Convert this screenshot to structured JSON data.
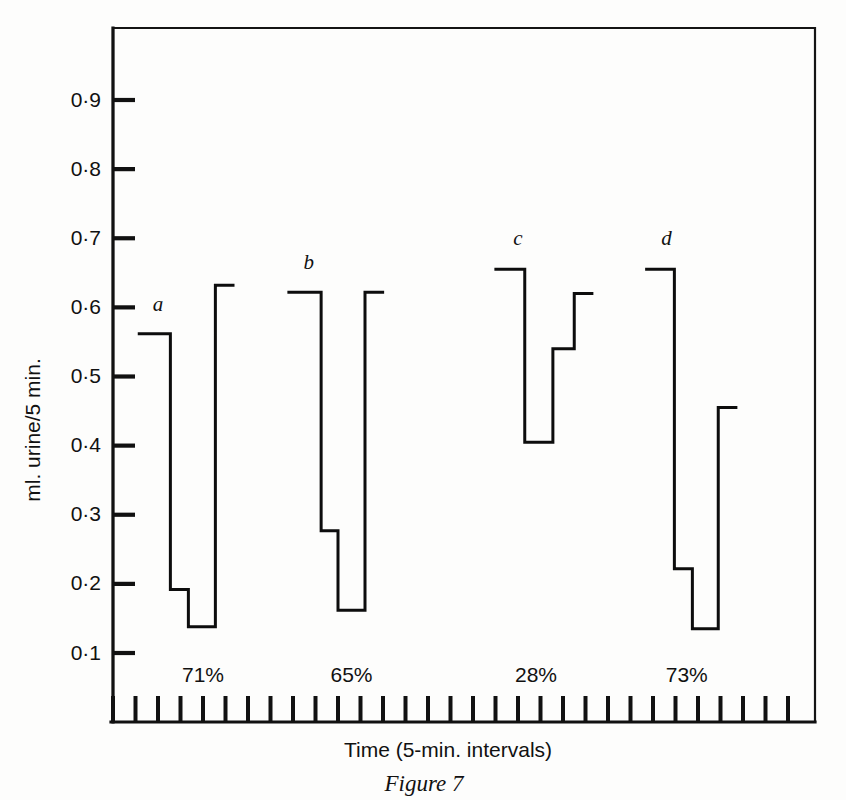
{
  "figure": {
    "caption": "Figure 7",
    "y_axis_title": "ml. urine/5 min.",
    "x_axis_title": "Time (5-min. intervals)"
  },
  "chart_data": {
    "type": "line",
    "title": "",
    "subtitle": "",
    "xlabel": "Time (5-min. intervals)",
    "ylabel": "ml. urine/5 min.",
    "ylim": [
      0,
      1.0
    ],
    "xlim": [
      0,
      31
    ],
    "grid": false,
    "legend": "none",
    "step_style": "post",
    "y_tick_labels": [
      "0·9",
      "0·8",
      "0·7",
      "0·6",
      "0·5",
      "0·4",
      "0·3",
      "0·2",
      "0·1"
    ],
    "y_tick_values": [
      0.9,
      0.8,
      0.7,
      0.6,
      0.5,
      0.4,
      0.3,
      0.2,
      0.1
    ],
    "x_tick_count": 31,
    "x_tick_labels": [],
    "annotations": [
      {
        "name": "a",
        "text": "a",
        "x": 2.0,
        "y": 0.595
      },
      {
        "name": "b",
        "text": "b",
        "x": 8.7,
        "y": 0.655
      },
      {
        "name": "c",
        "text": "c",
        "x": 18.0,
        "y": 0.69
      },
      {
        "name": "d",
        "text": "d",
        "x": 24.6,
        "y": 0.69
      }
    ],
    "percent_labels": [
      {
        "text": "71%",
        "x": 4.0
      },
      {
        "text": "65%",
        "x": 10.6
      },
      {
        "text": "28%",
        "x": 18.8
      },
      {
        "text": "73%",
        "x": 25.5
      }
    ],
    "series": [
      {
        "name": "a",
        "points": [
          {
            "x": 1.1,
            "y": 0.562
          },
          {
            "x": 2.55,
            "y": 0.562
          },
          {
            "x": 2.55,
            "y": 0.192
          },
          {
            "x": 3.35,
            "y": 0.192
          },
          {
            "x": 3.35,
            "y": 0.138
          },
          {
            "x": 4.55,
            "y": 0.138
          },
          {
            "x": 4.55,
            "y": 0.632
          },
          {
            "x": 5.4,
            "y": 0.632
          }
        ]
      },
      {
        "name": "b",
        "points": [
          {
            "x": 7.75,
            "y": 0.622
          },
          {
            "x": 9.25,
            "y": 0.622
          },
          {
            "x": 9.25,
            "y": 0.277
          },
          {
            "x": 10.0,
            "y": 0.277
          },
          {
            "x": 10.0,
            "y": 0.162
          },
          {
            "x": 11.2,
            "y": 0.162
          },
          {
            "x": 11.2,
            "y": 0.622
          },
          {
            "x": 12.05,
            "y": 0.622
          }
        ]
      },
      {
        "name": "c",
        "points": [
          {
            "x": 16.95,
            "y": 0.655
          },
          {
            "x": 18.3,
            "y": 0.655
          },
          {
            "x": 18.3,
            "y": 0.405
          },
          {
            "x": 19.55,
            "y": 0.405
          },
          {
            "x": 19.55,
            "y": 0.54
          },
          {
            "x": 20.5,
            "y": 0.54
          },
          {
            "x": 20.5,
            "y": 0.62
          },
          {
            "x": 21.35,
            "y": 0.62
          }
        ]
      },
      {
        "name": "d",
        "points": [
          {
            "x": 23.65,
            "y": 0.655
          },
          {
            "x": 24.95,
            "y": 0.655
          },
          {
            "x": 24.95,
            "y": 0.222
          },
          {
            "x": 25.75,
            "y": 0.222
          },
          {
            "x": 25.75,
            "y": 0.135
          },
          {
            "x": 26.9,
            "y": 0.135
          },
          {
            "x": 26.9,
            "y": 0.455
          },
          {
            "x": 27.75,
            "y": 0.455
          }
        ]
      }
    ]
  }
}
